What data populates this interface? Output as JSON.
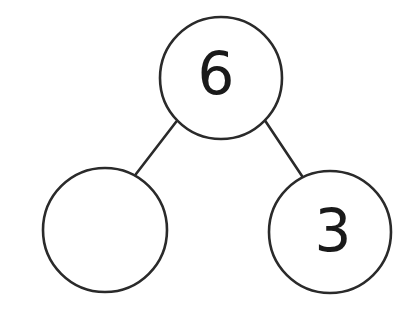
{
  "diagram": {
    "background_color": "#ffffff",
    "stroke_color": "#2a2a2a",
    "text_color": "#1a1a1a",
    "stroke_width": 2.6,
    "nodes": [
      {
        "id": "whole",
        "role": "whole",
        "label": "6",
        "filled": true,
        "cx": 221,
        "cy": 78,
        "r": 61
      },
      {
        "id": "part-left",
        "role": "part",
        "label": "",
        "filled": false,
        "cx": 105,
        "cy": 230,
        "r": 62
      },
      {
        "id": "part-right",
        "role": "part",
        "label": "3",
        "filled": true,
        "cx": 330,
        "cy": 232,
        "r": 61
      }
    ],
    "connectors": [
      {
        "id": "whole-to-left",
        "from": "whole",
        "to": "part-left",
        "x1": 176,
        "y1": 122,
        "x2": 136,
        "y2": 174
      },
      {
        "id": "whole-to-right",
        "from": "whole",
        "to": "part-right",
        "x1": 264,
        "y1": 119,
        "x2": 302,
        "y2": 176
      }
    ],
    "font_size": 58
  }
}
